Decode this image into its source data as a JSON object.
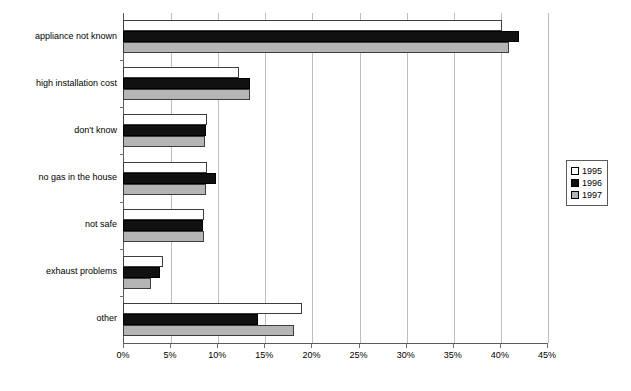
{
  "chart_data": {
    "type": "bar",
    "orientation": "horizontal",
    "title": "",
    "xlabel": "",
    "ylabel": "",
    "xlim": [
      0,
      45
    ],
    "xtick_labels": [
      "0%",
      "5%",
      "10%",
      "15%",
      "20%",
      "25%",
      "30%",
      "35%",
      "40%",
      "45%"
    ],
    "xtick_values": [
      0,
      5,
      10,
      15,
      20,
      25,
      30,
      35,
      40,
      45
    ],
    "grid": true,
    "legend_position": "right",
    "categories": [
      "appliance not known",
      "high installation cost",
      "don't know",
      "no gas in the house",
      "not safe",
      "exhaust problems",
      "other"
    ],
    "series": [
      {
        "name": "1995",
        "color": "#ffffff",
        "values": [
          40.2,
          12.3,
          8.9,
          8.9,
          8.6,
          4.2,
          19.0
        ]
      },
      {
        "name": "1996",
        "color": "#111111",
        "values": [
          42.0,
          13.5,
          8.8,
          9.9,
          8.5,
          3.9,
          14.3
        ]
      },
      {
        "name": "1997",
        "color": "#b5b5b5",
        "values": [
          41.0,
          13.5,
          8.7,
          8.8,
          8.6,
          3.0,
          18.1
        ]
      }
    ]
  },
  "legend": {
    "entries": [
      {
        "label": "1995"
      },
      {
        "label": "1996"
      },
      {
        "label": "1997"
      }
    ]
  }
}
